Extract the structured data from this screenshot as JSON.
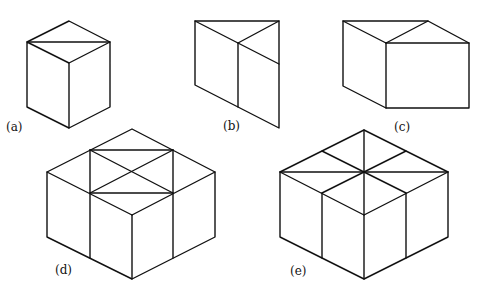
{
  "figure": {
    "panels": [
      {
        "id": "a",
        "label": "(a)",
        "label_pos": [
          6,
          131
        ]
      },
      {
        "id": "b",
        "label": "(b)",
        "label_pos": [
          223,
          130
        ]
      },
      {
        "id": "c",
        "label": "(c)",
        "label_pos": [
          394,
          131
        ]
      },
      {
        "id": "d",
        "label": "(d)",
        "label_pos": [
          55,
          274
        ]
      },
      {
        "id": "e",
        "label": "(e)",
        "label_pos": [
          290,
          275
        ]
      }
    ]
  }
}
